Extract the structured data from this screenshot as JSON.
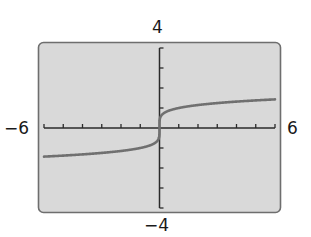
{
  "chart_data": {
    "type": "line",
    "title": "",
    "xlabel": "",
    "ylabel": "",
    "xlim": [
      -6,
      6
    ],
    "ylim": [
      -4,
      4
    ],
    "xscale_ticks": 1,
    "yscale_ticks": 1,
    "grid": false,
    "window_labels": {
      "xmin": "−6",
      "xmax": "6",
      "ymin": "−4",
      "ymax": "4"
    },
    "series": [
      {
        "name": "f(x)",
        "function": "y = x^(1/5) (odd root)",
        "x": [
          -6,
          -5,
          -4,
          -3,
          -2,
          -1,
          -0.5,
          -0.1,
          -0.01,
          0,
          0.01,
          0.1,
          0.5,
          1,
          2,
          3,
          4,
          5,
          6
        ],
        "y": [
          -1.43,
          -1.38,
          -1.32,
          -1.25,
          -1.15,
          -1.0,
          -0.87,
          -0.63,
          -0.4,
          0,
          0.4,
          0.63,
          0.87,
          1.0,
          1.15,
          1.25,
          1.32,
          1.38,
          1.43
        ]
      }
    ],
    "colors": {
      "screen": "#d9d9d9",
      "frame": "#6e6e6e",
      "curve": "#707070",
      "axes": "#2a2a2a"
    }
  }
}
